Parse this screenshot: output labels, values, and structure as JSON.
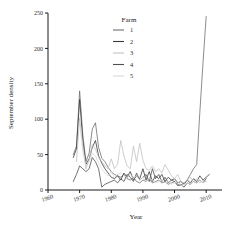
{
  "chart_data": {
    "type": "line",
    "title": "",
    "xlabel": "Year",
    "ylabel": "September density",
    "xlim": [
      1960,
      2015
    ],
    "ylim": [
      0,
      250
    ],
    "xticks": [
      1960,
      1970,
      1980,
      1990,
      2000,
      2010
    ],
    "yticks": [
      0,
      50,
      100,
      150,
      200,
      250
    ],
    "grid": false,
    "legend": {
      "title": "Farm",
      "position": "top-center",
      "entries": [
        {
          "label": "1",
          "color": "#6f6f6f"
        },
        {
          "label": "2",
          "color": "#3a3a3a"
        },
        {
          "label": "3",
          "color": "#c2c2c2"
        },
        {
          "label": "4",
          "color": "#4f4f4f"
        },
        {
          "label": "5",
          "color": "#d8d8d8"
        }
      ]
    },
    "series": [
      {
        "name": "1",
        "color": "#6f6f6f",
        "x": [
          1968,
          1969,
          1970,
          1971,
          1972,
          1973,
          1974,
          1975,
          1976,
          1977,
          1978,
          1979,
          1980,
          1981,
          1982,
          1983,
          1984,
          1985,
          1986,
          1987,
          1988,
          1989,
          1990,
          1991,
          1992,
          1993,
          1994,
          1995,
          1996,
          1997,
          1998,
          1999,
          2000,
          2001,
          2002,
          2003,
          2004,
          2005,
          2006,
          2007,
          2008,
          2009,
          2010
        ],
        "y": [
          50,
          62,
          140,
          78,
          40,
          52,
          86,
          95,
          60,
          45,
          40,
          32,
          26,
          22,
          20,
          18,
          22,
          16,
          14,
          18,
          12,
          10,
          14,
          12,
          16,
          10,
          12,
          14,
          10,
          12,
          8,
          10,
          12,
          8,
          6,
          10,
          14,
          22,
          30,
          36,
          110,
          180,
          245
        ]
      },
      {
        "name": "2",
        "color": "#3a3a3a",
        "x": [
          1968,
          1969,
          1970,
          1971,
          1972,
          1973,
          1974,
          1975,
          1976,
          1977,
          1978,
          1979,
          1980,
          1981,
          1982,
          1983,
          1984,
          1985,
          1986,
          1987,
          1988,
          1989,
          1990,
          1991,
          1992,
          1993,
          1994,
          1995,
          1996,
          1997,
          1998,
          1999,
          2000,
          2001,
          2002,
          2003,
          2004,
          2005,
          2006,
          2007,
          2008,
          2009,
          2010,
          2011
        ],
        "y": [
          46,
          58,
          128,
          70,
          36,
          44,
          60,
          70,
          48,
          38,
          30,
          24,
          18,
          16,
          20,
          14,
          24,
          18,
          26,
          14,
          20,
          16,
          30,
          14,
          26,
          12,
          20,
          16,
          22,
          12,
          18,
          14,
          16,
          10,
          12,
          8,
          14,
          10,
          16,
          12,
          20,
          14,
          18,
          22
        ]
      },
      {
        "name": "3",
        "color": "#c2c2c2",
        "x": [
          1969,
          1970,
          1971,
          1972,
          1973,
          1974,
          1975,
          1976,
          1977,
          1978,
          1979,
          1980,
          1981,
          1982,
          1983,
          1984,
          1985,
          1986,
          1987,
          1988,
          1989,
          1990,
          1991,
          1992,
          1993,
          1994,
          1995,
          1996,
          1997,
          1998,
          1999,
          2000,
          2001,
          2002,
          2003,
          2004,
          2005,
          2006,
          2007,
          2008,
          2009,
          2010
        ],
        "y": [
          40,
          102,
          62,
          30,
          42,
          64,
          58,
          46,
          40,
          34,
          30,
          44,
          30,
          36,
          70,
          48,
          34,
          30,
          62,
          40,
          66,
          42,
          30,
          28,
          34,
          26,
          30,
          24,
          36,
          28,
          20,
          16,
          22,
          12,
          10,
          14,
          18,
          12,
          16,
          10,
          14,
          12
        ]
      },
      {
        "name": "4",
        "color": "#4f4f4f",
        "x": [
          1968,
          1969,
          1970,
          1971,
          1972,
          1973,
          1974,
          1975,
          1976,
          1977,
          1978,
          1979,
          1980,
          1981,
          1982,
          1983,
          1984,
          1985,
          1986,
          1987,
          1988,
          1989,
          1990,
          1991,
          1992,
          1993,
          1994,
          1995,
          1996,
          1997,
          1998,
          1999,
          2000,
          2001,
          2002,
          2003,
          2004,
          2005,
          2006,
          2007,
          2008,
          2009,
          2010
        ],
        "y": [
          12,
          22,
          34,
          30,
          26,
          30,
          46,
          40,
          30,
          4,
          8,
          10,
          12,
          14,
          10,
          16,
          12,
          22,
          18,
          12,
          24,
          14,
          18,
          22,
          12,
          30,
          16,
          22,
          12,
          18,
          10,
          14,
          12,
          6,
          8,
          4,
          10,
          8,
          12,
          10,
          14,
          10,
          16
        ]
      },
      {
        "name": "5",
        "color": "#d8d8d8",
        "x": [
          1970,
          1971,
          1972,
          1973,
          1974,
          1975,
          1976,
          1977,
          1978,
          1979,
          1980,
          1981,
          1982,
          1983,
          1984,
          1985,
          1986,
          1987,
          1988,
          1989,
          1990,
          1991,
          1992,
          1993,
          1994,
          1995,
          1996,
          1997,
          1998,
          1999,
          2000,
          2001,
          2002,
          2003,
          2004,
          2005,
          2006,
          2007,
          2008,
          2009,
          2010
        ],
        "y": [
          95,
          55,
          34,
          40,
          52,
          48,
          38,
          30,
          24,
          20,
          26,
          18,
          22,
          24,
          20,
          18,
          22,
          16,
          20,
          14,
          18,
          12,
          16,
          14,
          10,
          12,
          14,
          10,
          12,
          8,
          10,
          12,
          6,
          8,
          10,
          8,
          12,
          10,
          14,
          10,
          12
        ]
      }
    ]
  }
}
